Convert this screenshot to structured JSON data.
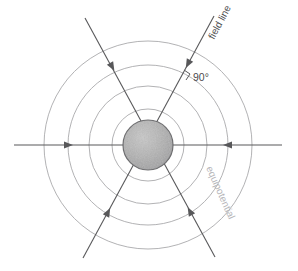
{
  "figure": {
    "width": 298,
    "height": 271,
    "background_color": "#ffffff"
  },
  "colors": {
    "field_line": "#58585a",
    "equipotential": "#a9a9ac",
    "sphere_fill": "#b0b0b0",
    "sphere_stroke": "#6e6e70",
    "label_dark": "#4b4b4d",
    "label_light": "#b5b5b8",
    "angle_marker": "#58585a"
  },
  "center": {
    "cx": 148,
    "cy": 145
  },
  "sphere": {
    "name": "charged-sphere",
    "radius": 25,
    "fill": "#b0b0b0",
    "stroke": "#6e6e70"
  },
  "equipotentials": {
    "count": 4,
    "radii": [
      36,
      59,
      80,
      104
    ],
    "stroke": "#a9a9ac",
    "stroke_width": 0.9
  },
  "field_lines": [
    {
      "name": "field-line-horizontal",
      "x1": 14,
      "y1": 145,
      "x2": 282,
      "y2": 145,
      "arrows": [
        {
          "x": 64,
          "y": 145,
          "angle": 0
        },
        {
          "x": 232,
          "y": 145,
          "angle": 180
        }
      ]
    },
    {
      "name": "field-line-upper-left-to-lower-right",
      "x1": 85,
      "y1": 18,
      "x2": 215,
      "y2": 257,
      "arrows": [
        {
          "x": 110,
          "y": 63,
          "angle": 61
        },
        {
          "x": 192,
          "y": 215,
          "angle": 241
        }
      ]
    },
    {
      "name": "field-line-upper-right-to-lower-left",
      "x1": 214,
      "y1": 16,
      "x2": 83,
      "y2": 258,
      "arrows": [
        {
          "x": 190,
          "y": 60,
          "angle": 118
        },
        {
          "x": 106,
          "y": 216,
          "angle": 298
        }
      ]
    }
  ],
  "labels": {
    "field_line": {
      "text": "field line",
      "color": "#4b4b4d",
      "font_size": 10,
      "x": 216,
      "y": 38,
      "rotation": -62
    },
    "angle": {
      "text": "90°",
      "color": "#4b4b4d",
      "font_size": 10,
      "x": 195,
      "y": 82
    },
    "equipotential": {
      "text": "equipotential",
      "color": "#b5b5b8",
      "font_size": 10,
      "x": 215,
      "y": 176,
      "rotation": 66
    }
  },
  "angle_marker": {
    "name": "right-angle-marker",
    "x": 186,
    "y": 73,
    "size": 7
  }
}
